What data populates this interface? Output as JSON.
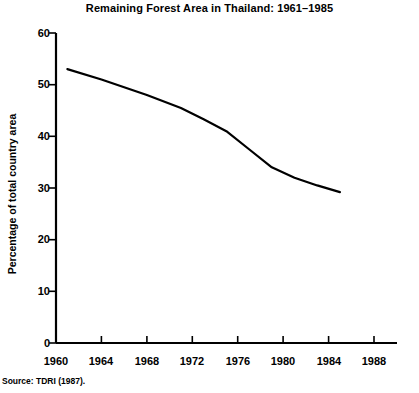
{
  "chart_data": {
    "type": "line",
    "title": "Remaining Forest Area in Thailand: 1961–1985",
    "xlabel": "",
    "ylabel": "Percentage of total country area",
    "xlim": [
      1960,
      1988
    ],
    "ylim": [
      0,
      60
    ],
    "grid": false,
    "legend": null,
    "x_ticks": [
      "1960",
      "1964",
      "1968",
      "1972",
      "1976",
      "1980",
      "1984",
      "1988"
    ],
    "y_ticks": [
      "0",
      "10",
      "20",
      "30",
      "40",
      "50",
      "60"
    ],
    "series": [
      {
        "name": "Remaining forest area",
        "x": [
          1961,
          1964,
          1968,
          1971,
          1973,
          1975,
          1977,
          1979,
          1981,
          1983,
          1985
        ],
        "values": [
          53.0,
          51.0,
          48.0,
          45.5,
          43.3,
          41.0,
          37.5,
          34.0,
          32.0,
          30.5,
          29.2
        ]
      }
    ],
    "source": "Source: TDRI (1987)."
  },
  "style": {
    "line_color": "#000000",
    "axis_color": "#000000",
    "background": "#ffffff"
  }
}
